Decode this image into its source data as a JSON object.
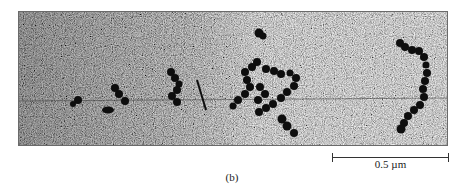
{
  "figure": {
    "panel_label": "(b)",
    "image_description": "Grayscale electron micrograph showing dark beaded chain-like aggregates on a grainy background",
    "scale_bar": {
      "label": "0.5  µm",
      "length_px": 117
    },
    "colors": {
      "background_gray": "#8a8a8a",
      "particle_dark": "#111111",
      "text": "#222222"
    }
  }
}
